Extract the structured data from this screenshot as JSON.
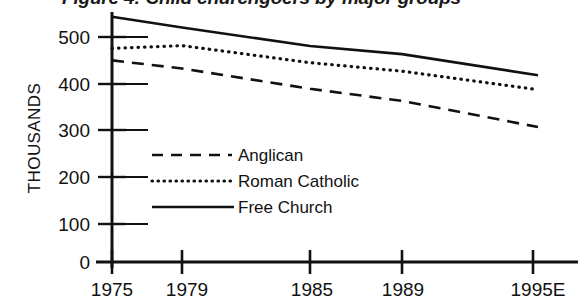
{
  "chart_data": {
    "type": "line",
    "title": "Figure 4: Child churchgoers by major groups",
    "xlabel": "",
    "ylabel": "THOUSANDS",
    "x": [
      "1975",
      "1979",
      "1985",
      "1989",
      "1995E"
    ],
    "x_numeric": [
      1975,
      1979,
      1985,
      1989,
      1995
    ],
    "xlim": [
      1975,
      1995
    ],
    "ylim": [
      0,
      500
    ],
    "yticks": [
      "0",
      "100",
      "200",
      "300",
      "400",
      "500"
    ],
    "ytick_values": [
      0,
      100,
      200,
      300,
      400,
      500
    ],
    "grid": false,
    "legend_position": "center-left",
    "series": [
      {
        "name": "Anglican",
        "style": "dashed",
        "values": [
          448,
          430,
          385,
          358,
          300
        ]
      },
      {
        "name": "Roman Catholic",
        "style": "dotted",
        "values": [
          475,
          481,
          443,
          424,
          383
        ]
      },
      {
        "name": "Free Church",
        "style": "solid",
        "values": [
          545,
          521,
          480,
          462,
          415
        ]
      }
    ]
  },
  "axes": {
    "y_caption": "THOUSANDS",
    "y_ticks": [
      "500",
      "400",
      "300",
      "200",
      "100",
      "0"
    ],
    "x_ticks": [
      "1975",
      "1979",
      "1985",
      "1989",
      "1995E"
    ]
  },
  "legend": {
    "items": [
      {
        "label": "Anglican",
        "style": "dashed"
      },
      {
        "label": "Roman Catholic",
        "style": "dotted"
      },
      {
        "label": "Free Church",
        "style": "solid"
      }
    ]
  },
  "colors": {
    "ink": "#111111",
    "background": "#ffffff"
  }
}
